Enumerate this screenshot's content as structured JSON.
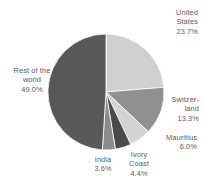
{
  "chart_data": {
    "type": "pie",
    "title": "",
    "subtitle": "",
    "xlabel": "",
    "ylabel": "",
    "legend_position": "none",
    "grid": false,
    "labels_position": "outside",
    "start_angle_deg": 0,
    "direction": "clockwise",
    "categories": [
      "United States",
      "Switzerland",
      "Mauritius",
      "Ivory Coast",
      "India",
      "Rest of the world"
    ],
    "values": [
      23.7,
      13.3,
      6.0,
      4.4,
      3.6,
      49.0
    ],
    "value_unit": "%",
    "slices": [
      {
        "name": "United States",
        "label_line1": "United",
        "label_line2": "States",
        "value": 23.7,
        "value_text": "23.7%",
        "color": "#cfcfcf",
        "start_deg": 0.0,
        "end_deg": 85.32
      },
      {
        "name": "Switzerland",
        "label_line1": "Switzer-",
        "label_line2": "land",
        "value": 13.3,
        "value_text": "13.3%",
        "color": "#909090",
        "start_deg": 85.32,
        "end_deg": 133.2
      },
      {
        "name": "Mauritius",
        "label_line1": "Mauritius",
        "label_line2": "",
        "value": 6.0,
        "value_text": "6.0%",
        "color": "#d3d3d3",
        "start_deg": 133.2,
        "end_deg": 154.8
      },
      {
        "name": "Ivory Coast",
        "label_line1": "Ivory",
        "label_line2": "Coast",
        "value": 4.4,
        "value_text": "4.4%",
        "color": "#4a4a4a",
        "start_deg": 154.8,
        "end_deg": 170.64
      },
      {
        "name": "India",
        "label_line1": "India",
        "label_line2": "",
        "value": 3.6,
        "value_text": "3.6%",
        "color": "#8c8c8c",
        "start_deg": 170.64,
        "end_deg": 183.6
      },
      {
        "name": "Rest of the world",
        "label_line1": "Rest of the",
        "label_line2": "world",
        "value": 49.0,
        "value_text": "49.0%",
        "color": "#585858",
        "start_deg": 183.6,
        "end_deg": 360.0
      }
    ]
  },
  "labels": {
    "united_states": "United\nStates\n23.7%",
    "switzerland": "Switzer-\nland\n13.3%",
    "mauritius": "Mauritius\n6.0%",
    "ivory_coast": "Ivory\nCoast\n4.4%",
    "india": "India\n3.6%",
    "rest_of_world": "Rest of the\nworld\n49.0%"
  },
  "geometry": {
    "center_x": 106,
    "center_y": 92,
    "radius": 58
  },
  "colors": {
    "background": "#ffffff",
    "label_text": "#5b5b5b",
    "slice_united_states": "#cfcfcf",
    "slice_switzerland": "#909090",
    "slice_mauritius": "#d3d3d3",
    "slice_ivory_coast": "#4a4a4a",
    "slice_india": "#8c8c8c",
    "slice_rest_of_world": "#585858"
  }
}
